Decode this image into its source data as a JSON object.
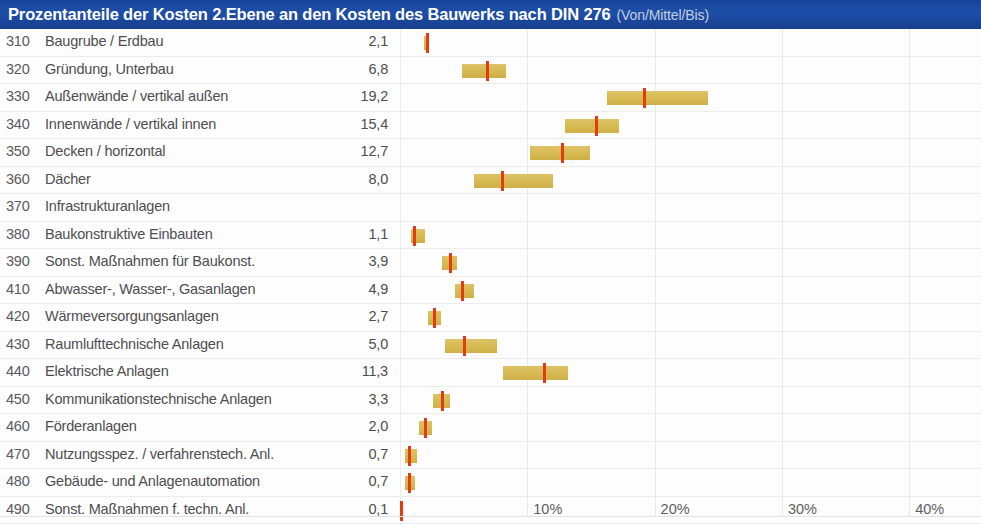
{
  "header": {
    "title": "Prozentanteile der Kosten 2.Ebene an den Kosten des Bauwerks nach DIN 276",
    "subtitle": "(Von/Mittel/Bis)",
    "bar_color": "#1b4a9e",
    "title_color": "#ffffff",
    "subtitle_color": "#c3cede"
  },
  "style": {
    "range_bar_color": "#d8bc5a",
    "marker_color": "#e23c10",
    "text_color": "#4e4e50",
    "gridline_color": "#e9e9ea"
  },
  "chart_data": {
    "type": "bar",
    "title": "Prozentanteile der Kosten 2.Ebene an den Kosten des Bauwerks nach DIN 276",
    "subtitle": "(Von/Mittel/Bis)",
    "xlabel": "",
    "ylabel": "",
    "xlim": [
      0,
      45.7
    ],
    "grid": true,
    "legend": "none",
    "xticks": [
      10,
      20,
      30,
      40
    ],
    "xticklabels": [
      "10%",
      "20%",
      "30%",
      "40%"
    ],
    "categories": [
      "Baugrube / Erdbau",
      "Gründung, Unterbau",
      "Außenwände / vertikal außen",
      "Innenwände / vertikal innen",
      "Decken / horizontal",
      "Dächer",
      "Infrastrukturanlagen",
      "Baukonstruktive Einbauten",
      "Sonst. Maßnahmen für Baukonst.",
      "Abwasser-, Wasser-, Gasanlagen",
      "Wärmeversorgungsanlagen",
      "Raumlufttechnische Anlagen",
      "Elektrische Anlagen",
      "Kommunikationstechnische Anlagen",
      "Förderanlagen",
      "Nutzungsspez. / verfahrenstech. Anl.",
      "Gebäude- und Anlagenautomation",
      "Sonst. Maßnahmen f. techn. Anl."
    ],
    "codes": [
      "310",
      "320",
      "330",
      "340",
      "350",
      "360",
      "370",
      "380",
      "390",
      "410",
      "420",
      "430",
      "440",
      "450",
      "460",
      "470",
      "480",
      "490"
    ],
    "values": [
      2.1,
      6.8,
      19.2,
      15.4,
      12.7,
      8.0,
      null,
      1.1,
      3.9,
      4.9,
      2.7,
      5.0,
      11.3,
      3.3,
      2.0,
      0.7,
      0.7,
      0.1
    ],
    "series": [
      {
        "name": "Von",
        "values": [
          1.9,
          4.9,
          16.3,
          13.0,
          10.2,
          5.8,
          null,
          0.9,
          3.3,
          4.3,
          2.2,
          3.5,
          8.1,
          2.6,
          1.5,
          0.4,
          0.4,
          0.05
        ]
      },
      {
        "name": "Mittel",
        "values": [
          2.1,
          6.8,
          19.2,
          15.4,
          12.7,
          8.0,
          null,
          1.1,
          3.9,
          4.9,
          2.7,
          5.0,
          11.3,
          3.3,
          2.0,
          0.7,
          0.7,
          0.1
        ]
      },
      {
        "name": "Bis",
        "values": [
          2.3,
          8.3,
          24.2,
          17.2,
          14.9,
          12.0,
          null,
          2.0,
          4.5,
          5.8,
          3.2,
          7.6,
          13.2,
          3.9,
          2.5,
          1.3,
          1.2,
          0.25
        ]
      }
    ]
  },
  "rows": [
    {
      "code": "310",
      "label": "Baugrube / Erdbau",
      "value": "2,1",
      "von": 1.9,
      "mittel": 2.1,
      "bis": 2.3
    },
    {
      "code": "320",
      "label": "Gründung, Unterbau",
      "value": "6,8",
      "von": 4.9,
      "mittel": 6.8,
      "bis": 8.3
    },
    {
      "code": "330",
      "label": "Außenwände / vertikal außen",
      "value": "19,2",
      "von": 16.3,
      "mittel": 19.2,
      "bis": 24.2
    },
    {
      "code": "340",
      "label": "Innenwände / vertikal innen",
      "value": "15,4",
      "von": 13.0,
      "mittel": 15.4,
      "bis": 17.2
    },
    {
      "code": "350",
      "label": "Decken / horizontal",
      "value": "12,7",
      "von": 10.2,
      "mittel": 12.7,
      "bis": 14.9
    },
    {
      "code": "360",
      "label": "Dächer",
      "value": "8,0",
      "von": 5.8,
      "mittel": 8.0,
      "bis": 12.0
    },
    {
      "code": "370",
      "label": "Infrastrukturanlagen",
      "value": "",
      "von": null,
      "mittel": null,
      "bis": null
    },
    {
      "code": "380",
      "label": "Baukonstruktive Einbauten",
      "value": "1,1",
      "von": 0.9,
      "mittel": 1.1,
      "bis": 2.0
    },
    {
      "code": "390",
      "label": "Sonst. Maßnahmen für Baukonst.",
      "value": "3,9",
      "von": 3.3,
      "mittel": 3.9,
      "bis": 4.5
    },
    {
      "code": "410",
      "label": "Abwasser-, Wasser-, Gasanlagen",
      "value": "4,9",
      "von": 4.3,
      "mittel": 4.9,
      "bis": 5.8
    },
    {
      "code": "420",
      "label": "Wärmeversorgungsanlagen",
      "value": "2,7",
      "von": 2.2,
      "mittel": 2.7,
      "bis": 3.2
    },
    {
      "code": "430",
      "label": "Raumlufttechnische Anlagen",
      "value": "5,0",
      "von": 3.5,
      "mittel": 5.0,
      "bis": 7.6
    },
    {
      "code": "440",
      "label": "Elektrische Anlagen",
      "value": "11,3",
      "von": 8.1,
      "mittel": 11.3,
      "bis": 13.2
    },
    {
      "code": "450",
      "label": "Kommunikationstechnische Anlagen",
      "value": "3,3",
      "von": 2.6,
      "mittel": 3.3,
      "bis": 3.9
    },
    {
      "code": "460",
      "label": "Förderanlagen",
      "value": "2,0",
      "von": 1.5,
      "mittel": 2.0,
      "bis": 2.5
    },
    {
      "code": "470",
      "label": "Nutzungsspez. / verfahrenstech. Anl.",
      "value": "0,7",
      "von": 0.4,
      "mittel": 0.7,
      "bis": 1.3
    },
    {
      "code": "480",
      "label": "Gebäude- und Anlagenautomation",
      "value": "0,7",
      "von": 0.4,
      "mittel": 0.7,
      "bis": 1.2
    },
    {
      "code": "490",
      "label": "Sonst. Maßnahmen f. techn. Anl.",
      "value": "0,1",
      "von": 0.05,
      "mittel": 0.1,
      "bis": 0.25
    }
  ],
  "axis": {
    "ticks": [
      {
        "label": "10%",
        "value": 10
      },
      {
        "label": "20%",
        "value": 20
      },
      {
        "label": "30%",
        "value": 30
      },
      {
        "label": "40%",
        "value": 40
      }
    ]
  }
}
